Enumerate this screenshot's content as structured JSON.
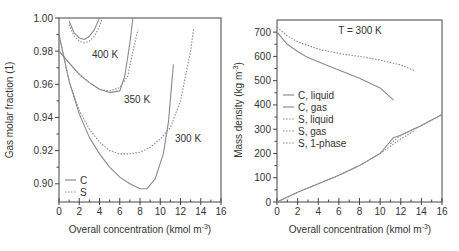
{
  "chart_data": [
    {
      "type": "line",
      "title": "",
      "xlabel": "Overall concentration (kmol m^-3)",
      "ylabel": "Gas molar fraction (1)",
      "xlim": [
        0,
        16
      ],
      "ylim": [
        0.889,
        1.0
      ],
      "xticks": [
        "0",
        "2",
        "4",
        "6",
        "8",
        "10",
        "12",
        "14",
        "16"
      ],
      "yticks": [
        "0.90",
        "0.92",
        "0.94",
        "0.96",
        "0.98",
        "1.00"
      ],
      "grid": false,
      "legend": {
        "position": "lower left",
        "entries": [
          "C",
          "S"
        ]
      },
      "annotations": [
        "400 K",
        "350 K",
        "300 K"
      ],
      "series": [
        {
          "name": "C 400 K",
          "style": "solid",
          "x": [
            1.0,
            1.5,
            2.0,
            2.5,
            3.0,
            3.5,
            4.0
          ],
          "y": [
            0.998,
            0.991,
            0.988,
            0.987,
            0.989,
            0.993,
            1.0
          ]
        },
        {
          "name": "S 400 K",
          "style": "dotted",
          "x": [
            1.0,
            1.5,
            2.0,
            2.5,
            3.0,
            3.5,
            4.0,
            4.3
          ],
          "y": [
            0.996,
            0.989,
            0.986,
            0.985,
            0.986,
            0.989,
            0.995,
            1.0
          ]
        },
        {
          "name": "C 350 K",
          "style": "solid",
          "x": [
            0.0,
            1.0,
            2.0,
            3.0,
            4.0,
            5.0,
            6.0,
            6.5,
            7.0,
            7.3
          ],
          "y": [
            0.98,
            0.973,
            0.966,
            0.961,
            0.957,
            0.955,
            0.956,
            0.965,
            0.985,
            1.0
          ]
        },
        {
          "name": "S 350 K",
          "style": "dotted",
          "x": [
            0.0,
            1.0,
            2.0,
            3.0,
            4.0,
            5.0,
            6.0,
            6.8,
            7.3,
            7.8
          ],
          "y": [
            0.98,
            0.973,
            0.966,
            0.961,
            0.957,
            0.956,
            0.958,
            0.965,
            0.98,
            0.993
          ]
        },
        {
          "name": "C 300 K",
          "style": "solid",
          "x": [
            0.0,
            1.0,
            2.0,
            3.0,
            4.0,
            5.0,
            6.0,
            7.0,
            8.0,
            8.7,
            9.5,
            10.3,
            10.8,
            11.3
          ],
          "y": [
            0.99,
            0.962,
            0.942,
            0.928,
            0.918,
            0.91,
            0.904,
            0.9,
            0.897,
            0.897,
            0.903,
            0.918,
            0.937,
            0.972
          ]
        },
        {
          "name": "S 300 K",
          "style": "dotted",
          "x": [
            0.0,
            1.0,
            2.0,
            3.0,
            4.0,
            5.0,
            6.0,
            6.8,
            8.0,
            9.0,
            10.0,
            11.0,
            12.0,
            13.0,
            13.3
          ],
          "y": [
            0.99,
            0.962,
            0.944,
            0.933,
            0.925,
            0.92,
            0.918,
            0.918,
            0.919,
            0.922,
            0.927,
            0.934,
            0.95,
            0.98,
            0.994
          ]
        }
      ]
    },
    {
      "type": "line",
      "title": "T = 300 K",
      "xlabel": "Overall concentration (kmol m^-3)",
      "ylabel": "Mass density (kg m^-3)",
      "xlim": [
        0,
        16
      ],
      "ylim": [
        0,
        750
      ],
      "xticks": [
        "0",
        "2",
        "4",
        "6",
        "8",
        "10",
        "12",
        "14",
        "16"
      ],
      "yticks": [
        "0",
        "100",
        "200",
        "300",
        "400",
        "500",
        "600",
        "700"
      ],
      "grid": false,
      "legend": {
        "position": "center left",
        "entries": [
          "C, liquid",
          "C, gas",
          "S, liquid",
          "S, gas",
          "S, 1-phase"
        ]
      },
      "series": [
        {
          "name": "C, liquid",
          "style": "solid",
          "x": [
            0,
            1,
            2,
            3,
            5,
            8,
            10,
            11.3
          ],
          "y": [
            700,
            650,
            620,
            595,
            560,
            510,
            470,
            420
          ]
        },
        {
          "name": "C, gas",
          "style": "solid",
          "x": [
            0,
            2,
            4,
            6,
            8,
            10,
            11.3,
            12,
            14,
            16
          ],
          "y": [
            0,
            40,
            75,
            110,
            150,
            200,
            265,
            275,
            315,
            360
          ]
        },
        {
          "name": "S, liquid",
          "style": "dotted",
          "x": [
            0,
            1,
            2,
            4,
            6,
            8,
            10,
            11,
            12,
            13.4
          ],
          "y": [
            720,
            685,
            660,
            630,
            612,
            600,
            585,
            575,
            565,
            540
          ]
        },
        {
          "name": "S, gas",
          "style": "dotted",
          "x": [
            0,
            2,
            4,
            6,
            8,
            10,
            11,
            12,
            13.4
          ],
          "y": [
            0,
            40,
            75,
            110,
            150,
            200,
            230,
            260,
            295
          ]
        },
        {
          "name": "S, 1-phase",
          "style": "dotted",
          "x": [
            11,
            12,
            13,
            14,
            16
          ],
          "y": [
            240,
            275,
            295,
            315,
            360
          ]
        }
      ]
    }
  ],
  "left": {
    "ylabel": "Gas molar fraction (1)",
    "xlabel": "Overall concentration (kmol m",
    "xlabel_sup": "-3",
    "xlabel_end": ")",
    "legend": [
      "C",
      "S"
    ],
    "labels": {
      "k400": "400 K",
      "k350": "350 K",
      "k300": "300 K"
    },
    "yticks": [
      "1.00",
      "0.98",
      "0.96",
      "0.94",
      "0.92",
      "0.90"
    ],
    "xticks": [
      "0",
      "2",
      "4",
      "6",
      "8",
      "10",
      "12",
      "14",
      "16"
    ]
  },
  "right": {
    "title": "T = 300 K",
    "ylabel": "Mass density (kg m",
    "ylabel_sup": "-3",
    "ylabel_end": ")",
    "xlabel": "Overall concentration (kmol m",
    "xlabel_sup": "-3",
    "xlabel_end": ")",
    "legend": [
      "C, liquid",
      "C, gas",
      "S, liquid",
      "S, gas",
      "S, 1-phase"
    ],
    "yticks": [
      "700",
      "600",
      "500",
      "400",
      "300",
      "200",
      "100",
      "0"
    ],
    "xticks": [
      "0",
      "2",
      "4",
      "6",
      "8",
      "10",
      "12",
      "14",
      "16"
    ]
  },
  "colors": {
    "line": "#8a8a8a",
    "axis": "#444444",
    "text": "#333333"
  }
}
